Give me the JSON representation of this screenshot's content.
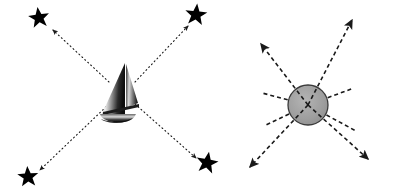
{
  "canvas": {
    "width": 395,
    "height": 195,
    "background_color": "#ffffff",
    "title": "Radiating arrow diagrams: sailboat with stars and shaded circle"
  },
  "palette": {
    "stroke_color": "#1a1a1a",
    "star_fill": "#000000",
    "circle_fill": "#9e9e9e",
    "circle_stroke": "#3a3a3a",
    "boat_hull_dark": "#1c1c1c",
    "boat_sail_light": "#f2f2f2",
    "boat_sail_mid": "#8a8a8a",
    "boat_sail_dark": "#111111"
  },
  "panels": [
    {
      "id": "left-panel",
      "name": "sailboat-star-burst",
      "center_object": {
        "kind": "sailboat-icon",
        "label": "Sailboat",
        "x": 120,
        "y": 92,
        "width": 44,
        "height": 58
      },
      "line_style": "dotted",
      "dash_pattern": "1,3",
      "stroke_width": 1.1,
      "arrowhead_size": "small",
      "rays": [
        {
          "id": "ray-up-left",
          "label": "Arrow to upper-left star",
          "x1": 109,
          "y1": 82,
          "x2": 53,
          "y2": 30,
          "arrow": "end"
        },
        {
          "id": "ray-up-right",
          "label": "Arrow to upper-right star",
          "x1": 135,
          "y1": 82,
          "x2": 188,
          "y2": 26,
          "arrow": "end"
        },
        {
          "id": "ray-down-left",
          "label": "Arrow to lower-left star",
          "x1": 109,
          "y1": 104,
          "x2": 40,
          "y2": 170,
          "arrow": "end"
        },
        {
          "id": "ray-down-right",
          "label": "Arrow to lower-right star",
          "x1": 135,
          "y1": 104,
          "x2": 196,
          "y2": 158,
          "arrow": "end"
        }
      ],
      "stars": [
        {
          "id": "star-top-left",
          "label": "Star top-left",
          "x": 39,
          "y": 18,
          "r": 11
        },
        {
          "id": "star-top-right",
          "label": "Star top-right",
          "x": 196,
          "y": 15,
          "r": 11
        },
        {
          "id": "star-bottom-left",
          "label": "Star bottom-left",
          "x": 28,
          "y": 177,
          "r": 11
        },
        {
          "id": "star-bottom-right",
          "label": "Star bottom-right",
          "x": 207,
          "y": 163,
          "r": 11
        }
      ]
    },
    {
      "id": "right-panel",
      "name": "circle-arrow-burst",
      "center_object": {
        "kind": "shaded-circle",
        "label": "Shaded circle",
        "cx": 308,
        "cy": 105,
        "r": 20
      },
      "line_style": "dashed",
      "dash_pattern": "4,3",
      "stroke_width": 1.6,
      "arrowhead_size": "large",
      "rays": [
        {
          "id": "ray-ne",
          "label": "Arrow to upper-right",
          "x1": 308,
          "y1": 105,
          "x2": 352,
          "y2": 20,
          "arrow": "end"
        },
        {
          "id": "ray-nw",
          "label": "Arrow to upper-left",
          "x1": 308,
          "y1": 105,
          "x2": 261,
          "y2": 44,
          "arrow": "end"
        },
        {
          "id": "ray-sw",
          "label": "Arrow to lower-left",
          "x1": 308,
          "y1": 105,
          "x2": 250,
          "y2": 167,
          "arrow": "end"
        },
        {
          "id": "ray-se",
          "label": "Arrow to lower-right",
          "x1": 308,
          "y1": 105,
          "x2": 368,
          "y2": 159,
          "arrow": "end"
        },
        {
          "id": "ray-shallow-w",
          "label": "Shallow line to left",
          "x1": 308,
          "y1": 105,
          "x2": 262,
          "y2": 93,
          "arrow": "none"
        },
        {
          "id": "ray-shallow-e",
          "label": "Shallow line to right",
          "x1": 308,
          "y1": 105,
          "x2": 354,
          "y2": 88,
          "arrow": "none"
        },
        {
          "id": "ray-shallow-sw",
          "label": "Shallow line lower-left",
          "x1": 308,
          "y1": 105,
          "x2": 264,
          "y2": 126,
          "arrow": "none"
        },
        {
          "id": "ray-shallow-se",
          "label": "Shallow line lower-right",
          "x1": 308,
          "y1": 105,
          "x2": 356,
          "y2": 131,
          "arrow": "none"
        }
      ]
    }
  ]
}
